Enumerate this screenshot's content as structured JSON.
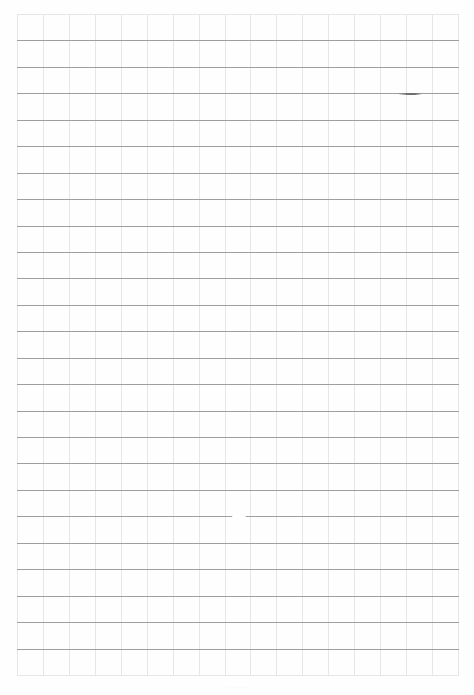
{
  "sheet": {
    "type": "grid-paper",
    "background": "#fefefe",
    "grid": {
      "left": 17,
      "top": 14,
      "right": 458,
      "bottom": 675,
      "columns": 17,
      "rows": 25,
      "horizontal_line_color": "#9e9e9e",
      "edge_line_color": "#e6e6e6",
      "vertical_line_color": "#e6e6e6"
    },
    "marks": [
      {
        "x1": 398,
        "x2": 422,
        "y": 94,
        "color": "#6f6f6f"
      },
      {
        "x1": 232,
        "x2": 246,
        "y": 517,
        "color": "#ffffff"
      }
    ],
    "footer_mark": "··········"
  }
}
